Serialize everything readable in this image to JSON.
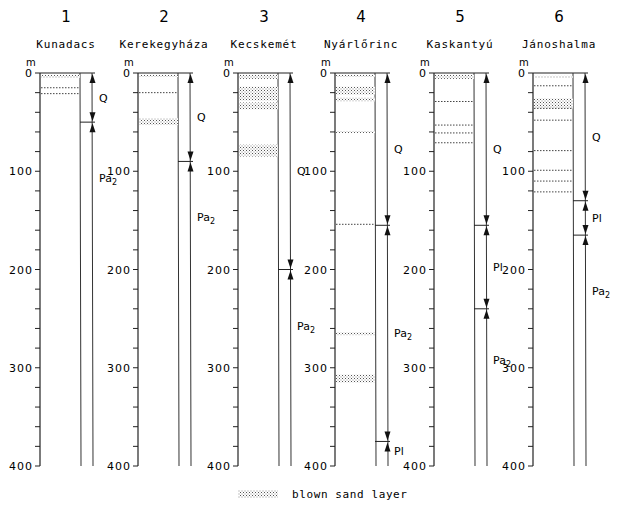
{
  "figure": {
    "unit_label": "m",
    "depth_ticks": [
      "0",
      "100",
      "200",
      "300",
      "400"
    ],
    "legend": {
      "label": "blown sand layer",
      "icon": "dotted-hatch-swatch"
    }
  },
  "columns": [
    {
      "number": "1",
      "name": "Kunadacs"
    },
    {
      "number": "2",
      "name": "Kerekegyháza"
    },
    {
      "number": "3",
      "name": "Kecskemét"
    },
    {
      "number": "4",
      "name": "Nyárlőrinc"
    },
    {
      "number": "5",
      "name": "Kaskantyú"
    },
    {
      "number": "6",
      "name": "Jánoshalma"
    }
  ],
  "chart_data": {
    "type": "table",
    "ylabel": "Depth (m)",
    "ylim": [
      0,
      400
    ],
    "legend": [
      "blown sand layer"
    ],
    "boreholes": [
      {
        "id": 1,
        "name": "Kunadacs",
        "blown_sand_layers_m": [
          [
            2,
            5
          ],
          [
            15,
            15
          ],
          [
            21,
            21
          ]
        ],
        "units": [
          {
            "label": "Q",
            "top": 0,
            "bottom": 50
          },
          {
            "label": "Pa2",
            "top": 50,
            "bottom": 400
          }
        ]
      },
      {
        "id": 2,
        "name": "Kerekegyháza",
        "blown_sand_layers_m": [
          [
            2,
            4
          ],
          [
            20,
            20
          ],
          [
            46,
            53
          ]
        ],
        "units": [
          {
            "label": "Q",
            "top": 0,
            "bottom": 90
          },
          {
            "label": "Pa2",
            "top": 90,
            "bottom": 400
          }
        ]
      },
      {
        "id": 3,
        "name": "Kecskemét",
        "blown_sand_layers_m": [
          [
            2,
            6
          ],
          [
            14,
            28
          ],
          [
            30,
            37
          ],
          [
            73,
            85
          ]
        ],
        "units": [
          {
            "label": "Q",
            "top": 0,
            "bottom": 200
          },
          {
            "label": "Pa2",
            "top": 200,
            "bottom": 400
          }
        ]
      },
      {
        "id": 4,
        "name": "Nyárlőrinc",
        "blown_sand_layers_m": [
          [
            2,
            4
          ],
          [
            14,
            22
          ],
          [
            25,
            29
          ],
          [
            59,
            61
          ],
          [
            154,
            154
          ],
          [
            264,
            267
          ],
          [
            307,
            315
          ]
        ],
        "units": [
          {
            "label": "Q",
            "top": 0,
            "bottom": 155
          },
          {
            "label": "Pa2",
            "top": 155,
            "bottom": 375
          },
          {
            "label": "Pl",
            "top": 375,
            "bottom": 400
          }
        ]
      },
      {
        "id": 5,
        "name": "Kaskantyú",
        "blown_sand_layers_m": [
          [
            2,
            6
          ],
          [
            29,
            29
          ],
          [
            53,
            53
          ],
          [
            61,
            61
          ],
          [
            71,
            71
          ]
        ],
        "units": [
          {
            "label": "Q",
            "top": 0,
            "bottom": 155
          },
          {
            "label": "Pl",
            "top": 155,
            "bottom": 240
          },
          {
            "label": "Pa2",
            "top": 240,
            "bottom": 400
          }
        ]
      },
      {
        "id": 6,
        "name": "Jánoshalma",
        "blown_sand_layers_m": [
          [
            3,
            5
          ],
          [
            13,
            13
          ],
          [
            26,
            36
          ],
          [
            36,
            36
          ],
          [
            48,
            48
          ],
          [
            79,
            79
          ],
          [
            99,
            99
          ],
          [
            110,
            111
          ],
          [
            121,
            121
          ]
        ],
        "units": [
          {
            "label": "Q",
            "top": 0,
            "bottom": 130
          },
          {
            "label": "Pl",
            "top": 130,
            "bottom": 165
          },
          {
            "label": "Pa2",
            "top": 165,
            "bottom": 400
          }
        ]
      }
    ]
  }
}
